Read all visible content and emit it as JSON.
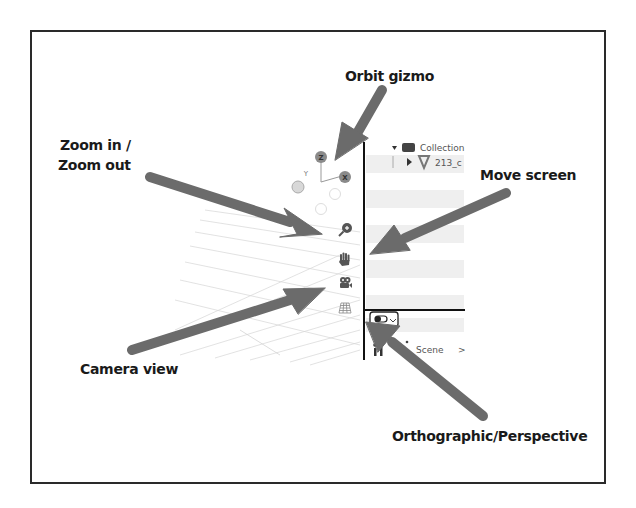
{
  "callouts": {
    "orbit_gizmo": "Orbit gizmo",
    "zoom_line1": "Zoom in /",
    "zoom_line2": "Zoom out",
    "move_screen": "Move screen",
    "camera_view": "Camera view",
    "ortho_persp": "Orthographic/Perspective"
  },
  "gizmo": {
    "z_label": "Z",
    "y_label": "Y",
    "x_label": "X"
  },
  "outliner": {
    "collection_label": "Collection",
    "object_label": "213_c"
  },
  "footer": {
    "scene_label": "Scene",
    "scene_chevron": ">"
  },
  "icons": {
    "zoom": "zoom-in-magnifier",
    "hand": "pan-hand",
    "camera": "camera",
    "grid": "ortho-grid"
  },
  "colors": {
    "arrow": "#6b6b6b",
    "frame": "#2a2a2a",
    "row_stripe": "#efefef",
    "gizmo_ball": "#8a8a8a"
  }
}
